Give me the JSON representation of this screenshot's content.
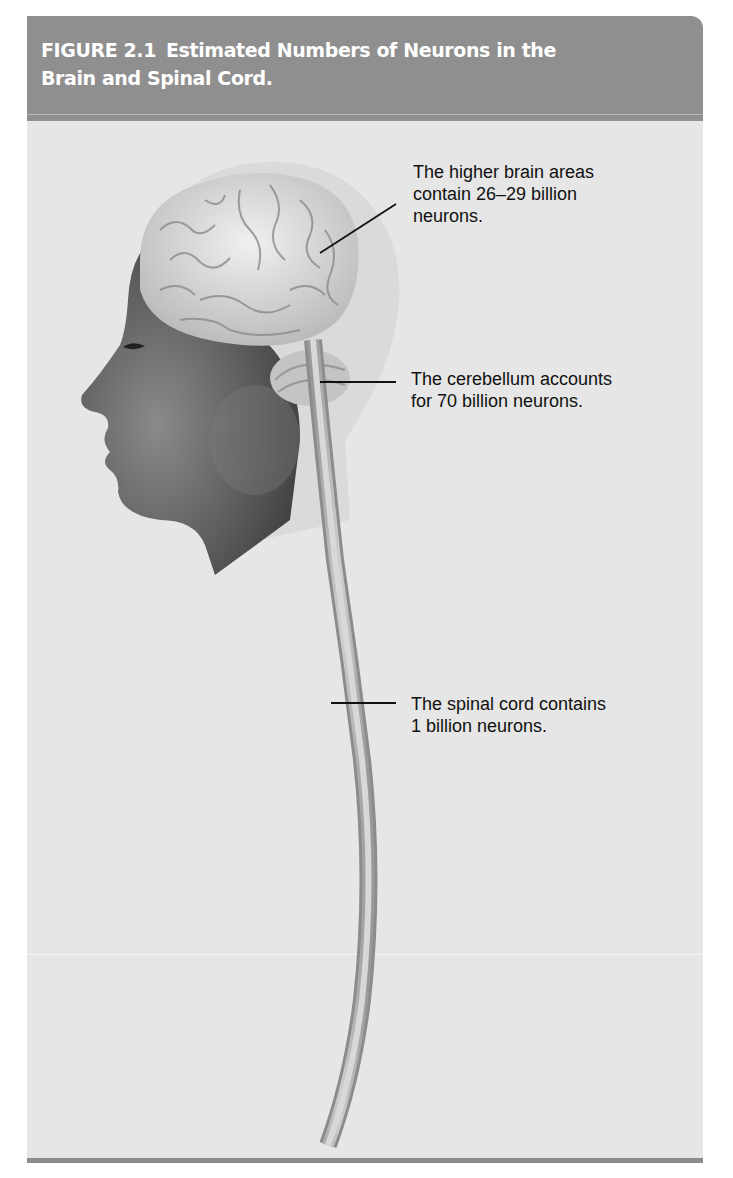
{
  "figure": {
    "number": "FIGURE 2.1",
    "title_line1": "Estimated Numbers of Neurons in the",
    "title_line2": "Brain and Spinal Cord.",
    "header_color": "#8f8f8f",
    "panel_color": "#e6e6e6"
  },
  "callouts": [
    {
      "region": "higher brain areas",
      "line1": "The higher brain areas",
      "line2": "contain 26–29 billion",
      "line3": "neurons."
    },
    {
      "region": "cerebellum",
      "line1": "The cerebellum accounts",
      "line2": "for 70 billion neurons."
    },
    {
      "region": "spinal cord",
      "line1": "The spinal cord contains",
      "line2": "1 billion neurons."
    }
  ]
}
